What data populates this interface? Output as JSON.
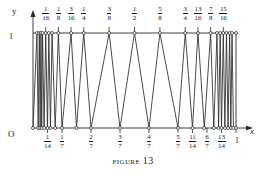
{
  "caption": {
    "word": "Figure",
    "number": "13"
  },
  "axes": {
    "y_label": "y",
    "x_label": "x",
    "origin_label": "O",
    "y_top_label": "1",
    "x_end_label": "1"
  },
  "chart_data": {
    "type": "line",
    "title": "Figure 13",
    "xlabel": "x",
    "ylabel": "y",
    "xlim": [
      0,
      1
    ],
    "ylim": [
      0,
      1
    ],
    "grid": false,
    "legend": null,
    "top_tick_labels": [
      {
        "num": "1",
        "den": "16",
        "value": 0.0625
      },
      {
        "num": "1",
        "den": "8",
        "value": 0.125
      },
      {
        "num": "3",
        "den": "16",
        "value": 0.1875
      },
      {
        "num": "1",
        "den": "4",
        "value": 0.25
      },
      {
        "num": "3",
        "den": "8",
        "value": 0.375
      },
      {
        "num": "1",
        "den": "2",
        "value": 0.5
      },
      {
        "num": "5",
        "den": "8",
        "value": 0.625
      },
      {
        "num": "3",
        "den": "4",
        "value": 0.75
      },
      {
        "num": "13",
        "den": "16",
        "value": 0.8125
      },
      {
        "num": "7",
        "den": "8",
        "value": 0.875
      },
      {
        "num": "15",
        "den": "16",
        "value": 0.9375
      }
    ],
    "bottom_tick_labels": [
      {
        "num": "1",
        "den": "14",
        "value": 0.07142857
      },
      {
        "num": "1",
        "den": "7",
        "value": 0.14285714
      },
      {
        "num": "2",
        "den": "7",
        "value": 0.28571429
      },
      {
        "num": "3",
        "den": "7",
        "value": 0.42857143
      },
      {
        "num": "4",
        "den": "7",
        "value": 0.57142857
      },
      {
        "num": "5",
        "den": "7",
        "value": 0.71428571
      },
      {
        "num": "11",
        "den": "14",
        "value": 0.78571429
      },
      {
        "num": "6",
        "den": "7",
        "value": 0.85714286
      },
      {
        "num": "13",
        "den": "14",
        "value": 0.92857143
      }
    ],
    "peaks_x": [
      0.0195,
      0.0312,
      0.0391,
      0.0469,
      0.0625,
      0.078,
      0.0938,
      0.125,
      0.1875,
      0.25,
      0.375,
      0.5,
      0.625,
      0.75,
      0.8125,
      0.875,
      0.9063,
      0.9219,
      0.9375,
      0.9531,
      0.9688,
      0.9805
    ],
    "valleys_x": [
      0.0,
      0.0255,
      0.0352,
      0.043,
      0.0547,
      0.0714,
      0.0859,
      0.1094,
      0.1429,
      0.2143,
      0.2857,
      0.4286,
      0.5714,
      0.7143,
      0.7857,
      0.8438,
      0.8906,
      0.9143,
      0.9286,
      0.9453,
      0.9609,
      0.9746,
      0.9873,
      1.0
    ],
    "marker_style": "open circle",
    "line_color": "#2b2b2b"
  }
}
